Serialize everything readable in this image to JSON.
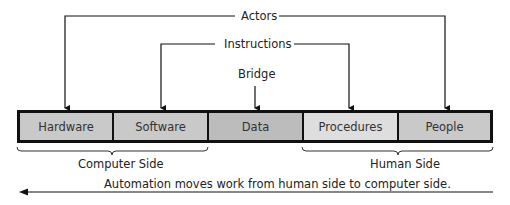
{
  "top_labels": {
    "actors": "Actors",
    "instructions": "Instructions",
    "bridge": "Bridge"
  },
  "components": [
    {
      "label": "Hardware",
      "fill": "#c9c9c9"
    },
    {
      "label": "Software",
      "fill": "#c9c9c9"
    },
    {
      "label": "Data",
      "fill": "#bcbcbc"
    },
    {
      "label": "Procedures",
      "fill": "#dedede"
    },
    {
      "label": "People",
      "fill": "#c9c9c9"
    }
  ],
  "groups": {
    "computer_side": "Computer Side",
    "human_side": "Human Side"
  },
  "automation_note": "Automation moves work from human side to computer side."
}
